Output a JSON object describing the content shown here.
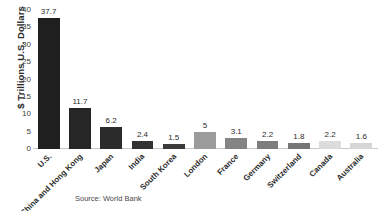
{
  "chart_data": {
    "type": "bar",
    "title": "",
    "subtitle": "",
    "xlabel": "",
    "ylabel": "$ Trillions U.S. Dollars",
    "ylim": [
      0,
      40
    ],
    "yticks": [
      40,
      35,
      30,
      25,
      20,
      15,
      10,
      5,
      0
    ],
    "ytick_labels": [
      "40",
      "35",
      "30",
      "25",
      "20",
      "15",
      "10",
      "5",
      "0"
    ],
    "grid": false,
    "legend": null,
    "categories": [
      "U.S.",
      "China and Hong Kong",
      "Japan",
      "India",
      "South Korea",
      "London",
      "France",
      "Germany",
      "Switzerland",
      "Canada",
      "Australia"
    ],
    "values": [
      37.7,
      11.7,
      6.2,
      2.4,
      1.5,
      5,
      3.1,
      2.2,
      1.8,
      2.2,
      1.6
    ],
    "value_labels": [
      "37.7",
      "11.7",
      "6.2",
      "2.4",
      "1.5",
      "5",
      "3.1",
      "2.2",
      "1.8",
      "2.2",
      "1.6"
    ],
    "bar_colors": [
      "#1f1f1f",
      "#262626",
      "#2b2b2b",
      "#333333",
      "#3b3b3b",
      "#9b9b9b",
      "#848484",
      "#7d7d7d",
      "#767676",
      "#dcdcdc",
      "#d6d6d6"
    ],
    "annotations": [
      "Source: World Bank"
    ]
  },
  "source": {
    "text": "Source: World Bank"
  }
}
